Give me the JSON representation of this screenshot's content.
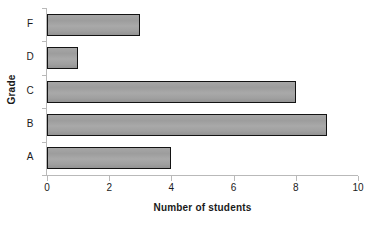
{
  "chart_data": {
    "type": "bar",
    "orientation": "horizontal",
    "title": "",
    "xlabel": "Number of students",
    "ylabel": "Grade",
    "categories": [
      "A",
      "B",
      "C",
      "D",
      "F"
    ],
    "values": [
      4,
      9,
      8,
      1,
      3
    ],
    "series": [
      {
        "name": "Number of students",
        "values": [
          4,
          9,
          8,
          1,
          3
        ]
      }
    ],
    "xlim": [
      0,
      10
    ],
    "xticks": [
      0,
      2,
      4,
      6,
      8,
      10
    ],
    "xtick_labels": [
      "0",
      "2",
      "4",
      "6",
      "8",
      "10"
    ],
    "ytick_labels_top_to_bottom": [
      "F",
      "D",
      "C",
      "B",
      "A"
    ],
    "grid": false,
    "legend": "none",
    "bar_fill_color": "#a1a1a1",
    "bar_border_color": "#131313",
    "axis_color": "#b9b9b9",
    "background_color": "#ffffff",
    "text_color": "#1a1a1a"
  },
  "axes": {
    "x_title": "Number of students",
    "y_title": "Grade"
  },
  "x_ticks": [
    {
      "label": "0",
      "value": 0
    },
    {
      "label": "2",
      "value": 2
    },
    {
      "label": "4",
      "value": 4
    },
    {
      "label": "6",
      "value": 6
    },
    {
      "label": "8",
      "value": 8
    },
    {
      "label": "10",
      "value": 10
    }
  ],
  "bars_top_to_bottom": [
    {
      "label": "F",
      "value": 3
    },
    {
      "label": "D",
      "value": 1
    },
    {
      "label": "C",
      "value": 8
    },
    {
      "label": "B",
      "value": 9
    },
    {
      "label": "A",
      "value": 4
    }
  ]
}
